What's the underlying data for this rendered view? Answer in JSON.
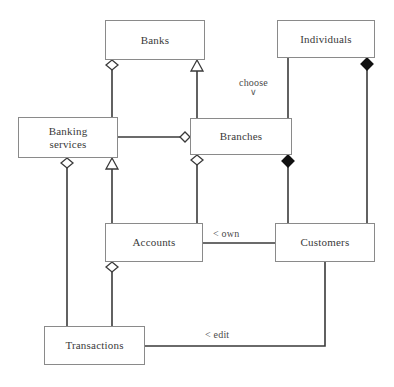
{
  "diagram": {
    "type": "uml-class-diagram",
    "canvas": {
      "width": 394,
      "height": 387,
      "background": "#ffffff"
    },
    "style": {
      "box_border": "#8a8a8a",
      "box_fill": "#ffffff",
      "line": "#3a3a3a",
      "text": "#3a3a3a",
      "label_text": "#4a4a4a",
      "hollow_fill": "#ffffff",
      "solid_fill": "#111111"
    },
    "nodes": [
      {
        "id": "banks",
        "label": "Banks",
        "x": 105,
        "y": 20,
        "w": 100,
        "h": 40
      },
      {
        "id": "individuals",
        "label": "Individuals",
        "x": 277,
        "y": 20,
        "w": 98,
        "h": 38
      },
      {
        "id": "banking",
        "label": "Banking\nservices",
        "x": 18,
        "y": 117,
        "w": 100,
        "h": 41
      },
      {
        "id": "branches",
        "label": "Branches",
        "x": 190,
        "y": 118,
        "w": 102,
        "h": 37
      },
      {
        "id": "accounts",
        "label": "Accounts",
        "x": 105,
        "y": 223,
        "w": 98,
        "h": 39
      },
      {
        "id": "customers",
        "label": "Customers",
        "x": 275,
        "y": 223,
        "w": 100,
        "h": 39
      },
      {
        "id": "transactions",
        "label": "Transactions",
        "x": 44,
        "y": 326,
        "w": 101,
        "h": 39
      }
    ],
    "edges": [
      {
        "id": "banking-banks",
        "from": "banking",
        "to": "banks",
        "decorator": "hollow-diamond",
        "decorator_at": "banks",
        "label": ""
      },
      {
        "id": "branches-banks",
        "from": "branches",
        "to": "banks",
        "decorator": "hollow-triangle",
        "decorator_at": "banks",
        "label": ""
      },
      {
        "id": "banking-branches",
        "from": "banking",
        "to": "branches",
        "decorator": "hollow-diamond",
        "decorator_at": "branches",
        "label": ""
      },
      {
        "id": "branches-individuals",
        "from": "branches",
        "to": "individuals",
        "decorator": "none",
        "decorator_at": "",
        "label": "choose"
      },
      {
        "id": "customers-individuals",
        "from": "customers",
        "to": "individuals",
        "decorator": "solid-diamond",
        "decorator_at": "individuals",
        "label": ""
      },
      {
        "id": "transactions-banking",
        "from": "transactions",
        "to": "banking",
        "decorator": "hollow-diamond",
        "decorator_at": "banking",
        "label": ""
      },
      {
        "id": "accounts-banking",
        "from": "accounts",
        "to": "banking",
        "decorator": "hollow-triangle",
        "decorator_at": "banking",
        "label": ""
      },
      {
        "id": "accounts-branches",
        "from": "accounts",
        "to": "branches",
        "decorator": "hollow-diamond",
        "decorator_at": "branches",
        "label": ""
      },
      {
        "id": "customers-branches",
        "from": "customers",
        "to": "branches",
        "decorator": "solid-diamond",
        "decorator_at": "branches",
        "label": ""
      },
      {
        "id": "accounts-customers",
        "from": "accounts",
        "to": "customers",
        "decorator": "none",
        "decorator_at": "",
        "label": "< own"
      },
      {
        "id": "transactions-accounts",
        "from": "transactions",
        "to": "accounts",
        "decorator": "hollow-diamond",
        "decorator_at": "accounts",
        "label": ""
      },
      {
        "id": "transactions-customers",
        "from": "transactions",
        "to": "customers",
        "decorator": "none",
        "decorator_at": "",
        "label": "< edit"
      }
    ],
    "labels": {
      "choose": {
        "text": "choose",
        "chevron": "∨",
        "x": 243,
        "y": 80
      },
      "own": {
        "text": "< own",
        "x": 215,
        "y": 228
      },
      "edit": {
        "text": "< edit",
        "x": 207,
        "y": 328
      }
    }
  }
}
